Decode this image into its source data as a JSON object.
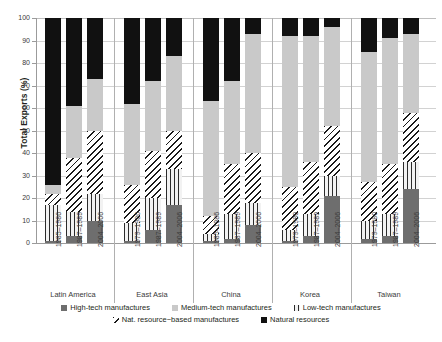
{
  "chart_data": {
    "type": "bar",
    "title": "",
    "xlabel": "",
    "ylabel": "Total Exports (%)",
    "ylim": [
      0,
      100
    ],
    "yticks": [
      0,
      10,
      20,
      30,
      40,
      50,
      60,
      70,
      80,
      90,
      100
    ],
    "grid": true,
    "stacked": true,
    "stack_order_bottom_to_top": [
      "High-tech manufactures",
      "Low-tech manufactures",
      "Nat. resource-based manufactures",
      "Medium-tech manufactures",
      "Natural resources"
    ],
    "legend_position": "bottom",
    "groups": [
      {
        "name": "Latin America",
        "categories": [
          "1985–1986",
          "1987–1989",
          "2004–2006"
        ],
        "bars": [
          {
            "period": "1985–1986",
            "high_tech": 1,
            "low_tech": 16,
            "nat_resource_based": 5,
            "medium_tech": 4,
            "natural_resources": 74
          },
          {
            "period": "1987–1989",
            "high_tech": 3,
            "low_tech": 11,
            "nat_resource_based": 24,
            "medium_tech": 23,
            "natural_resources": 39
          },
          {
            "period": "2004–2006",
            "high_tech": 10,
            "low_tech": 12,
            "nat_resource_based": 28,
            "medium_tech": 23,
            "natural_resources": 27
          }
        ]
      },
      {
        "name": "East Asia",
        "categories": [
          "1979–1980",
          "1987–1989",
          "2004–2006"
        ],
        "bars": [
          {
            "period": "1979–1980",
            "high_tech": 1,
            "low_tech": 8,
            "nat_resource_based": 17,
            "medium_tech": 36,
            "natural_resources": 38
          },
          {
            "period": "1987–1989",
            "high_tech": 6,
            "low_tech": 14,
            "nat_resource_based": 21,
            "medium_tech": 31,
            "natural_resources": 28
          },
          {
            "period": "2004–2006",
            "high_tech": 17,
            "low_tech": 16,
            "nat_resource_based": 17,
            "medium_tech": 33,
            "natural_resources": 17
          }
        ]
      },
      {
        "name": "China",
        "categories": [
          "1985–1986",
          "1987–1989",
          "2004–2006"
        ],
        "bars": [
          {
            "period": "1985–1986",
            "high_tech": 1,
            "low_tech": 3,
            "nat_resource_based": 8,
            "medium_tech": 51,
            "natural_resources": 37
          },
          {
            "period": "1987–1989",
            "high_tech": 2,
            "low_tech": 11,
            "nat_resource_based": 22,
            "medium_tech": 37,
            "natural_resources": 28
          },
          {
            "period": "2004–2006",
            "high_tech": 8,
            "low_tech": 10,
            "nat_resource_based": 22,
            "medium_tech": 53,
            "natural_resources": 7
          }
        ]
      },
      {
        "name": "Korea",
        "categories": [
          "1979–1980",
          "1987–1989",
          "2004–2006"
        ],
        "bars": [
          {
            "period": "1979–1980",
            "high_tech": 1,
            "low_tech": 5,
            "nat_resource_based": 19,
            "medium_tech": 67,
            "natural_resources": 8
          },
          {
            "period": "1987–1989",
            "high_tech": 3,
            "low_tech": 10,
            "nat_resource_based": 23,
            "medium_tech": 56,
            "natural_resources": 8
          },
          {
            "period": "2004–2006",
            "high_tech": 21,
            "low_tech": 9,
            "nat_resource_based": 22,
            "medium_tech": 44,
            "natural_resources": 4
          }
        ]
      },
      {
        "name": "Taiwan",
        "categories": [
          "1979–1980",
          "1987–1989",
          "2004–2006"
        ],
        "bars": [
          {
            "period": "1979–1980",
            "high_tech": 2,
            "low_tech": 8,
            "nat_resource_based": 17,
            "medium_tech": 58,
            "natural_resources": 15
          },
          {
            "period": "1987–1989",
            "high_tech": 3,
            "low_tech": 10,
            "nat_resource_based": 22,
            "medium_tech": 56,
            "natural_resources": 9
          },
          {
            "period": "2004–2006",
            "high_tech": 24,
            "low_tech": 12,
            "nat_resource_based": 22,
            "medium_tech": 35,
            "natural_resources": 7
          }
        ]
      }
    ],
    "legend": [
      {
        "label": "High-tech manufactures",
        "swatch": "high"
      },
      {
        "label": "Medium-tech manufactures",
        "swatch": "med"
      },
      {
        "label": "Low-tech manufactures",
        "swatch": "low"
      },
      {
        "label": "Nat. resource−based manufactures",
        "swatch": "natres"
      },
      {
        "label": "Natural resources",
        "swatch": "nat"
      }
    ]
  }
}
